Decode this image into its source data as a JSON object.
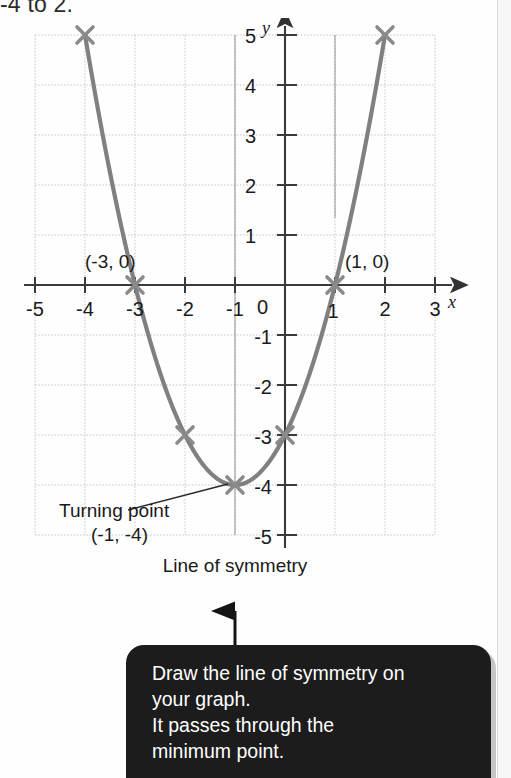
{
  "page": {
    "top_instruction": "-4 to 2.",
    "background_color": "#fefefe"
  },
  "graph": {
    "axis_label_x": "x",
    "axis_label_y": "y",
    "origin_label": "0",
    "x_tick_labels": [
      "-5",
      "-4",
      "-3",
      "-2",
      "-1",
      "2",
      "3"
    ],
    "y_tick_labels_pos": [
      "5",
      "4",
      "3",
      "2",
      "1"
    ],
    "y_tick_labels_neg": [
      "-1",
      "-2",
      "-3",
      "-4",
      "-5"
    ],
    "one_tick_label": "1",
    "curve_color": "#808080",
    "grid_color": "#c8c8d8",
    "axis_color": "#4a4a4a",
    "annotations": {
      "root_left": "(-3, 0)",
      "root_right": "(1, 0)",
      "turning_point_line1": "Turning point",
      "turning_point_line2": "(-1, -4)",
      "symmetry_line1": "Line of symmetry",
      "symmetry_line2": "x = -1"
    }
  },
  "callout": {
    "line1": "Draw the line of symmetry on",
    "line2": "your graph.",
    "line3": "It passes through the",
    "line4": "minimum point.",
    "background_color": "#1c1c1c",
    "text_color": "#ffffff"
  },
  "chart_data": {
    "type": "line",
    "title": "",
    "xlabel": "x",
    "ylabel": "y",
    "xlim": [
      -5,
      3
    ],
    "ylim": [
      -5,
      5
    ],
    "grid": true,
    "equation": "y = (x + 1)^2 - 4",
    "x": [
      -4,
      -3,
      -2,
      -1,
      0,
      1,
      2
    ],
    "values": [
      5,
      0,
      -3,
      -4,
      -3,
      0,
      5
    ],
    "marked_points": [
      {
        "x": -4,
        "y": 5
      },
      {
        "x": -3,
        "y": 0
      },
      {
        "x": -2,
        "y": -3
      },
      {
        "x": -1,
        "y": -4
      },
      {
        "x": 0,
        "y": -3
      },
      {
        "x": 1,
        "y": 0
      },
      {
        "x": 2,
        "y": 5
      }
    ],
    "roots": [
      -3,
      1
    ],
    "turning_point": {
      "x": -1,
      "y": -4
    },
    "line_of_symmetry": -1,
    "legend": []
  }
}
